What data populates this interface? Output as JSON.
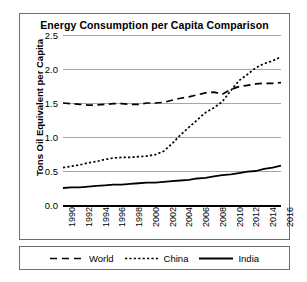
{
  "chart_data": {
    "type": "line",
    "title": "Energy Consumption per Capita Comparison",
    "xlabel": "",
    "ylabel": "Tons Oil Equivalent per Capita",
    "ylim": [
      0.0,
      2.5
    ],
    "xlim": [
      1990,
      2016
    ],
    "grid": true,
    "legend_position": "bottom",
    "ytick_labels": [
      "2.5",
      "2.0",
      "1.5",
      "1.0",
      "0.5",
      "0.0"
    ],
    "ytick_values": [
      2.5,
      2.0,
      1.5,
      1.0,
      0.5,
      0.0
    ],
    "xtick_labels": [
      "1990",
      "1992",
      "1994",
      "1996",
      "1998",
      "2000",
      "2002",
      "2004",
      "2006",
      "2008",
      "2010",
      "2012",
      "2014",
      "2016"
    ],
    "x": [
      1990,
      1991,
      1992,
      1993,
      1994,
      1995,
      1996,
      1997,
      1998,
      1999,
      2000,
      2001,
      2002,
      2003,
      2004,
      2005,
      2006,
      2007,
      2008,
      2009,
      2010,
      2011,
      2012,
      2013,
      2014,
      2015,
      2016
    ],
    "series": [
      {
        "name": "World",
        "style": "dashed",
        "color": "#000000",
        "values": [
          1.5,
          1.49,
          1.48,
          1.47,
          1.47,
          1.48,
          1.49,
          1.49,
          1.48,
          1.48,
          1.5,
          1.5,
          1.51,
          1.54,
          1.57,
          1.59,
          1.62,
          1.65,
          1.66,
          1.63,
          1.7,
          1.74,
          1.76,
          1.78,
          1.79,
          1.79,
          1.8
        ]
      },
      {
        "name": "China",
        "style": "dotted",
        "color": "#000000",
        "values": [
          0.55,
          0.57,
          0.59,
          0.62,
          0.64,
          0.67,
          0.69,
          0.7,
          0.7,
          0.71,
          0.72,
          0.74,
          0.79,
          0.9,
          1.03,
          1.14,
          1.25,
          1.36,
          1.43,
          1.52,
          1.68,
          1.83,
          1.92,
          2.02,
          2.08,
          2.12,
          2.18
        ]
      },
      {
        "name": "India",
        "style": "solid",
        "color": "#000000",
        "values": [
          0.25,
          0.26,
          0.26,
          0.27,
          0.28,
          0.29,
          0.3,
          0.3,
          0.31,
          0.32,
          0.33,
          0.33,
          0.34,
          0.35,
          0.36,
          0.37,
          0.39,
          0.4,
          0.42,
          0.44,
          0.45,
          0.47,
          0.49,
          0.5,
          0.53,
          0.55,
          0.58
        ]
      }
    ]
  },
  "legend": {
    "items": [
      {
        "label": "World"
      },
      {
        "label": "China"
      },
      {
        "label": "India"
      }
    ]
  }
}
